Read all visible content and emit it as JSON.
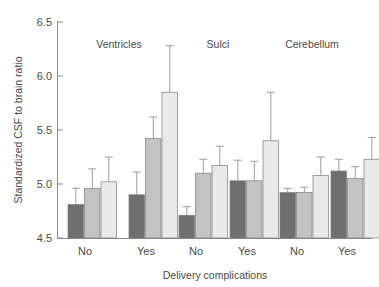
{
  "chart_data": {
    "type": "bar",
    "title": "",
    "xlabel": "Delivery complications",
    "ylabel": "Standardized CSF to brain ratio",
    "ylim": [
      4.5,
      6.5
    ],
    "yticks": [
      "4.5",
      "5.0",
      "5.5",
      "6.0",
      "6.5"
    ],
    "ytick_values": [
      4.5,
      5.0,
      5.5,
      6.0,
      6.5
    ],
    "grid": false,
    "legend_position": "none",
    "panel_titles": [
      "Ventricles",
      "Sulci",
      "Cerebellum"
    ],
    "categories": [
      "No",
      "Yes",
      "No",
      "Yes",
      "No",
      "Yes"
    ],
    "series": [
      {
        "name": "dark",
        "color": "#6f6f6f",
        "values": [
          4.81,
          4.9,
          4.71,
          5.03,
          4.92,
          5.12
        ],
        "err_upper": [
          4.96,
          5.11,
          4.79,
          5.22,
          4.96,
          5.23
        ],
        "err_lower": [
          4.66,
          4.69,
          4.63,
          4.84,
          4.88,
          5.01
        ]
      },
      {
        "name": "medium",
        "color": "#c3c3c3",
        "values": [
          4.96,
          5.42,
          5.1,
          5.03,
          4.92,
          5.05
        ],
        "err_upper": [
          5.14,
          5.62,
          5.23,
          5.21,
          4.97,
          5.16
        ],
        "err_lower": [
          4.78,
          5.22,
          4.97,
          4.85,
          4.87,
          4.94
        ]
      },
      {
        "name": "light",
        "color": "#e9e9e9",
        "values": [
          5.02,
          5.85,
          5.17,
          5.4,
          5.08,
          5.23
        ],
        "err_upper": [
          5.25,
          6.28,
          5.35,
          5.85,
          5.25,
          5.43
        ],
        "err_lower": [
          4.79,
          5.42,
          4.99,
          4.95,
          4.91,
          5.03
        ]
      }
    ],
    "groups": [
      {
        "panel": "Ventricles",
        "complication": "No",
        "bars": [
          4.81,
          4.96,
          5.02
        ]
      },
      {
        "panel": "Ventricles",
        "complication": "Yes",
        "bars": [
          4.9,
          5.42,
          5.85
        ]
      },
      {
        "panel": "Sulci",
        "complication": "No",
        "bars": [
          4.71,
          5.1,
          5.17
        ]
      },
      {
        "panel": "Sulci",
        "complication": "Yes",
        "bars": [
          5.03,
          5.03,
          5.4
        ]
      },
      {
        "panel": "Cerebellum",
        "complication": "No",
        "bars": [
          4.92,
          4.92,
          5.08
        ]
      },
      {
        "panel": "Cerebellum",
        "complication": "Yes",
        "bars": [
          5.12,
          5.05,
          5.23
        ]
      }
    ]
  },
  "colors": {
    "dark": "#6f6f6f",
    "medium": "#c3c3c3",
    "light": "#e9e9e9",
    "axis": "#8a8a8a",
    "text": "#4a4a4a",
    "background": "#ffffff"
  }
}
